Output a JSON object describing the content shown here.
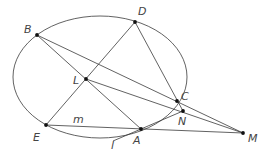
{
  "figure": {
    "type": "geometry-diagram",
    "colors": {
      "stroke": "#3a3a3a",
      "point": "#111111",
      "label": "#444444",
      "background": "#ffffff"
    },
    "ellipse": {
      "cx": 100,
      "cy": 77,
      "rx": 87,
      "ry": 61
    },
    "points": [
      {
        "id": "B",
        "label": "B",
        "x": 37,
        "y": 35,
        "lx": 24,
        "ly": 33
      },
      {
        "id": "D",
        "label": "D",
        "x": 135,
        "y": 22,
        "lx": 138,
        "ly": 15
      },
      {
        "id": "L",
        "label": "L",
        "x": 86,
        "y": 79,
        "lx": 73,
        "ly": 84
      },
      {
        "id": "C",
        "label": "C",
        "x": 177,
        "y": 101,
        "lx": 181,
        "ly": 100
      },
      {
        "id": "N",
        "label": "N",
        "x": 183,
        "y": 111,
        "lx": 178,
        "ly": 125
      },
      {
        "id": "E",
        "label": "E",
        "x": 46,
        "y": 125,
        "lx": 33,
        "ly": 141
      },
      {
        "id": "A",
        "label": "A",
        "x": 141,
        "y": 129,
        "lx": 133,
        "ly": 144
      },
      {
        "id": "M",
        "label": "M",
        "x": 243,
        "y": 133,
        "lx": 248,
        "ly": 142
      }
    ],
    "segments": [
      {
        "from": "B",
        "to": "M",
        "note": "passes through C"
      },
      {
        "from": "B",
        "to": "A",
        "note": "passes through L"
      },
      {
        "from": "D",
        "to": "E",
        "note": "passes through L"
      },
      {
        "from": "D",
        "to": "N",
        "note": "passes through C"
      },
      {
        "from": "L",
        "to": "M",
        "note": "passes through N"
      },
      {
        "from": "E",
        "to": "M",
        "note": "line m, passes through A"
      },
      {
        "from": "l_start",
        "to": "N",
        "note": "tangent line l at A"
      }
    ],
    "line_labels": [
      {
        "id": "m",
        "label": "m",
        "x": 73,
        "y": 123
      },
      {
        "id": "l",
        "label": "l",
        "x": 111,
        "y": 149
      }
    ],
    "tangent_l": {
      "x1": 113,
      "y1": 141,
      "x2": 183,
      "y2": 111
    }
  }
}
